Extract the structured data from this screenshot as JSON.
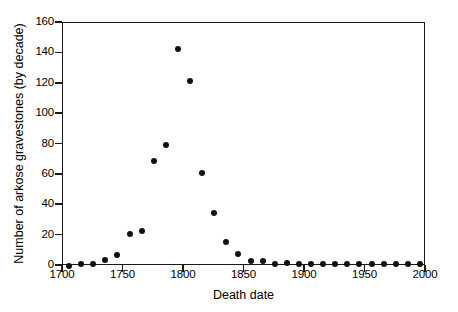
{
  "chart_data": {
    "type": "scatter",
    "title": "",
    "xlabel": "Death date",
    "ylabel": "Number of arkose gravestones (by decade)",
    "xlim": [
      1700,
      2000
    ],
    "ylim": [
      0,
      160
    ],
    "xticks": [
      1700,
      1750,
      1800,
      1850,
      1900,
      1950,
      2000
    ],
    "yticks": [
      0,
      20,
      40,
      60,
      80,
      100,
      120,
      140,
      160
    ],
    "grid": false,
    "legend": null,
    "marker": "filled-circle",
    "marker_color": "#111111",
    "frame": "box",
    "x": [
      1705,
      1715,
      1725,
      1735,
      1745,
      1755,
      1765,
      1775,
      1785,
      1795,
      1805,
      1815,
      1825,
      1835,
      1845,
      1855,
      1865,
      1875,
      1885,
      1895,
      1905,
      1915,
      1925,
      1935,
      1945,
      1955,
      1965,
      1975,
      1985,
      1995
    ],
    "y": [
      0,
      1,
      1,
      4,
      7,
      21,
      23,
      69,
      80,
      143,
      122,
      61,
      35,
      16,
      8,
      3,
      3,
      1,
      2,
      1,
      1,
      1,
      1,
      1,
      1,
      1,
      1,
      1,
      1,
      1
    ],
    "points": [
      {
        "x": 1705,
        "y": 0
      },
      {
        "x": 1715,
        "y": 1
      },
      {
        "x": 1725,
        "y": 1
      },
      {
        "x": 1735,
        "y": 4
      },
      {
        "x": 1745,
        "y": 7
      },
      {
        "x": 1755,
        "y": 21
      },
      {
        "x": 1765,
        "y": 23
      },
      {
        "x": 1775,
        "y": 69
      },
      {
        "x": 1785,
        "y": 80
      },
      {
        "x": 1795,
        "y": 143
      },
      {
        "x": 1805,
        "y": 122
      },
      {
        "x": 1815,
        "y": 61
      },
      {
        "x": 1825,
        "y": 35
      },
      {
        "x": 1835,
        "y": 16
      },
      {
        "x": 1845,
        "y": 8
      },
      {
        "x": 1855,
        "y": 3
      },
      {
        "x": 1865,
        "y": 3
      },
      {
        "x": 1875,
        "y": 1
      },
      {
        "x": 1885,
        "y": 2
      },
      {
        "x": 1895,
        "y": 1
      },
      {
        "x": 1905,
        "y": 1
      },
      {
        "x": 1915,
        "y": 1
      },
      {
        "x": 1925,
        "y": 1
      },
      {
        "x": 1935,
        "y": 1
      },
      {
        "x": 1945,
        "y": 1
      },
      {
        "x": 1955,
        "y": 1
      },
      {
        "x": 1965,
        "y": 1
      },
      {
        "x": 1975,
        "y": 1
      },
      {
        "x": 1985,
        "y": 1
      },
      {
        "x": 1995,
        "y": 1
      }
    ]
  }
}
